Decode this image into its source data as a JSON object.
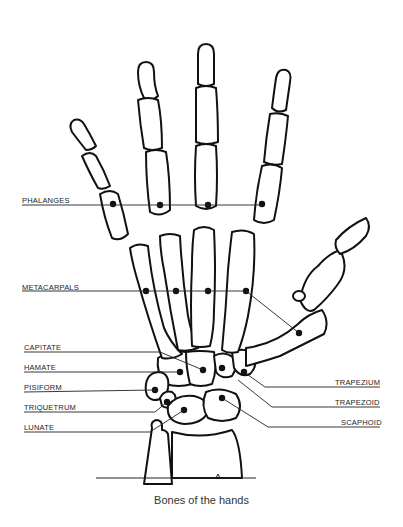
{
  "caption": "Bones of the hands",
  "labels": {
    "left": [
      {
        "text": "PHALANGES",
        "x": 22,
        "y": 196
      },
      {
        "text": "METACARPALS",
        "x": 22,
        "y": 283
      },
      {
        "text": "CAPITATE",
        "x": 24,
        "y": 343
      },
      {
        "text": "HAMATE",
        "x": 24,
        "y": 363
      },
      {
        "text": "PISIFORM",
        "x": 24,
        "y": 383
      },
      {
        "text": "TRIQUETRUM",
        "x": 24,
        "y": 403
      },
      {
        "text": "LUNATE",
        "x": 24,
        "y": 423
      }
    ],
    "right": [
      {
        "text": "TRAPEZIUM",
        "x": 335,
        "y": 378
      },
      {
        "text": "TRAPEZOID",
        "x": 335,
        "y": 398
      },
      {
        "text": "SCAPHOID",
        "x": 341,
        "y": 418
      }
    ]
  },
  "colors": {
    "ink": "#111111",
    "paper": "#ffffff"
  }
}
